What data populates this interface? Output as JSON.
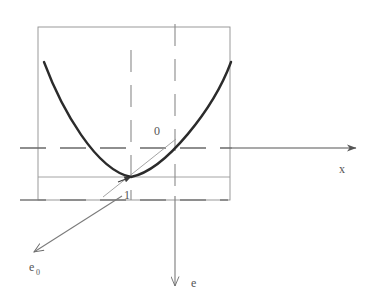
{
  "figure": {
    "kind": "geometry-diagram",
    "background_color": "#ffffff",
    "labels": {
      "axis_x": "x",
      "axis_e": "e",
      "axis_e0_base": "e",
      "axis_e0_subscript": "0",
      "point_origin": "0",
      "point_one": "1"
    },
    "colors": {
      "curve": "#2b2b2b",
      "axis": "#555555",
      "box": "#8a8a8a",
      "thin_line": "#9a9a9a",
      "text": "#555555"
    },
    "elements": {
      "box_label": "bounding-rectangle",
      "curve_label": "parabola",
      "horizontal_axis_label": "x-axis",
      "vertical_axis_label": "e-axis",
      "diagonal_axis_label": "e0-axis",
      "dashed_vertical_left_label": "dashed-vertical-left",
      "dashed_vertical_right_label": "dashed-vertical-right",
      "tangent_label": "tangent-line",
      "baseline_label": "vertex-baseline"
    }
  }
}
